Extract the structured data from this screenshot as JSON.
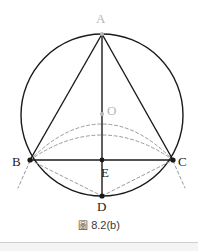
{
  "figure": {
    "caption_marker": "圖",
    "caption_text": "8.2(b)",
    "colors": {
      "stroke": "#1a1a1a",
      "dashed_stroke": "#8c8c8c",
      "muted_label": "#b6b6b6",
      "label": "#1a1a1a",
      "background": "#ffffff",
      "rule": "#cfcfcf"
    },
    "circle": {
      "center_x": 102,
      "center_y": 115,
      "radius": 81
    },
    "points": [
      {
        "id": "A",
        "label": "A",
        "x": 102,
        "y": 34,
        "style": "muted",
        "dot": true
      },
      {
        "id": "O",
        "label": "O",
        "x": 102,
        "y": 114,
        "style": "muted",
        "dot": true
      },
      {
        "id": "B",
        "label": "B",
        "x": 30,
        "y": 160,
        "style": "solid",
        "dot": true
      },
      {
        "id": "C",
        "label": "C",
        "x": 173,
        "y": 160,
        "style": "solid",
        "dot": true
      },
      {
        "id": "E",
        "label": "E",
        "x": 102,
        "y": 160,
        "style": "solid",
        "dot": true
      },
      {
        "id": "D",
        "label": "D",
        "x": 102,
        "y": 196,
        "style": "solid",
        "dot": true
      }
    ],
    "solid_segments": [
      {
        "name": "segment-AB",
        "from": "A",
        "to": "B"
      },
      {
        "name": "segment-AC",
        "from": "A",
        "to": "C"
      },
      {
        "name": "segment-AD",
        "from": "A",
        "to": "D"
      },
      {
        "name": "segment-BC",
        "from": "B",
        "to": "C"
      }
    ],
    "dashed_segments": [
      {
        "name": "segment-BD",
        "from": "B",
        "to": "D"
      },
      {
        "name": "segment-DC",
        "from": "D",
        "to": "C"
      }
    ],
    "dashed_arcs": [
      {
        "name": "arc-B-O-C",
        "from": "B",
        "to": "C",
        "apex_y": 114
      },
      {
        "name": "arc-B-low-C",
        "from": "B",
        "to": "C",
        "apex_y": 131
      }
    ],
    "tangent_stubs": [
      {
        "name": "tangent-stub-at-B",
        "x1": 30,
        "y1": 162,
        "x2": 18,
        "y2": 188
      },
      {
        "name": "tangent-stub-at-C",
        "x1": 173,
        "y1": 162,
        "x2": 185,
        "y2": 188
      }
    ]
  }
}
